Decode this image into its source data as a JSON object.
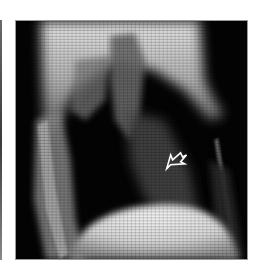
{
  "image": {
    "subject": "lateral chest radiograph",
    "annotation": "arrow",
    "background_color": "#ffffff",
    "frame_color": "#020202",
    "arrow_color": "#ffffff"
  }
}
